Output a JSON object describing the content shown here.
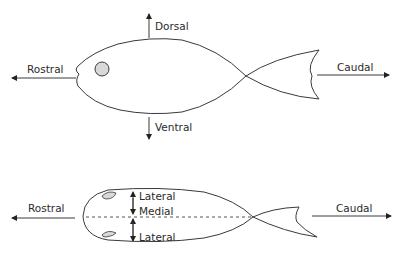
{
  "diagram": {
    "top_view": {
      "title": "Lateral view of fish",
      "labels": {
        "dorsal": "Dorsal",
        "ventral": "Ventral",
        "rostral": "Rostral",
        "caudal": "Caudal"
      }
    },
    "bottom_view": {
      "title": "Dorsal view of fish",
      "labels": {
        "rostral": "Rostral",
        "caudal": "Caudal",
        "lateral_top": "Lateral",
        "medial": "Medial",
        "lateral_bottom": "Lateral"
      }
    },
    "colors": {
      "line": "#3a3a3a",
      "eye_fill": "#d8d8d8",
      "background": "#ffffff"
    }
  }
}
